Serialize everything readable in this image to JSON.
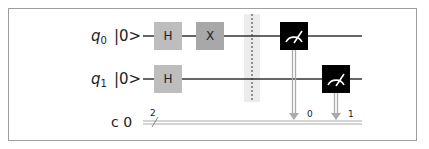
{
  "circuit": {
    "qubits": [
      {
        "name": "q",
        "index": "0",
        "init": "|0>"
      },
      {
        "name": "q",
        "index": "1",
        "init": "|0>"
      }
    ],
    "classical": {
      "label": "c 0",
      "width": "2"
    },
    "gates": [
      {
        "type": "H",
        "qubit": 0,
        "label": "H"
      },
      {
        "type": "X",
        "qubit": 0,
        "label": "X"
      },
      {
        "type": "H",
        "qubit": 1,
        "label": "H"
      }
    ],
    "barrier": true,
    "measurements": [
      {
        "qubit": 0,
        "cbit": "0"
      },
      {
        "qubit": 1,
        "cbit": "1"
      }
    ],
    "colors": {
      "h_gate": "#bdbdbd",
      "x_gate": "#a8a8a8",
      "measure": "#000000",
      "wire": "#333333",
      "classical_wire": "#aaaaaa",
      "barrier_band": "#ececec"
    }
  }
}
